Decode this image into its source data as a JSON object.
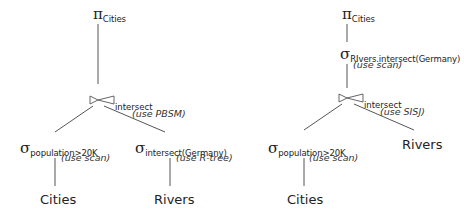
{
  "plans": [
    {
      "name": "plan-left",
      "projection": {
        "symbol": "π",
        "subscript": "Cities"
      },
      "join": {
        "symbol": "⋈",
        "subscript": "intersect",
        "note": "(use PBSM)"
      },
      "left_select": {
        "symbol": "σ",
        "subscript": "population>20K",
        "note": "(use scan)"
      },
      "right_select": {
        "symbol": "σ",
        "subscript": "intersect(Germany)",
        "note": "(use R-tree)"
      },
      "left_leaf": "Cities",
      "right_leaf": "Rivers"
    },
    {
      "name": "plan-right",
      "projection": {
        "symbol": "π",
        "subscript": "Cities"
      },
      "top_select": {
        "symbol": "σ",
        "subscript": "RIvers.intersect(Germany)",
        "note": "(use scan)"
      },
      "join": {
        "symbol": "⋈",
        "subscript": "intersect",
        "note": "(use SISJ)"
      },
      "left_select": {
        "symbol": "σ",
        "subscript": "population>20K",
        "note": "(use scan)"
      },
      "left_leaf": "Cities",
      "right_leaf": "Rivers"
    }
  ],
  "colors": {
    "line": "#555555",
    "text": "#222222"
  }
}
